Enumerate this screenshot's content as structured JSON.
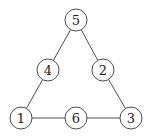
{
  "diagram": {
    "type": "triangle-number-puzzle",
    "nodes": [
      {
        "id": "top",
        "label": "5",
        "x": 76,
        "y": 20
      },
      {
        "id": "mid-left",
        "label": "4",
        "x": 48,
        "y": 70
      },
      {
        "id": "mid-right",
        "label": "2",
        "x": 103,
        "y": 70
      },
      {
        "id": "bottom-left",
        "label": "1",
        "x": 21,
        "y": 118
      },
      {
        "id": "bottom-mid",
        "label": "6",
        "x": 76,
        "y": 118
      },
      {
        "id": "bottom-right",
        "label": "3",
        "x": 131,
        "y": 118
      }
    ],
    "edges": [
      [
        "top",
        "mid-left"
      ],
      [
        "mid-left",
        "bottom-left"
      ],
      [
        "top",
        "mid-right"
      ],
      [
        "mid-right",
        "bottom-right"
      ],
      [
        "bottom-left",
        "bottom-mid"
      ],
      [
        "bottom-mid",
        "bottom-right"
      ]
    ],
    "node_radius": 11
  }
}
